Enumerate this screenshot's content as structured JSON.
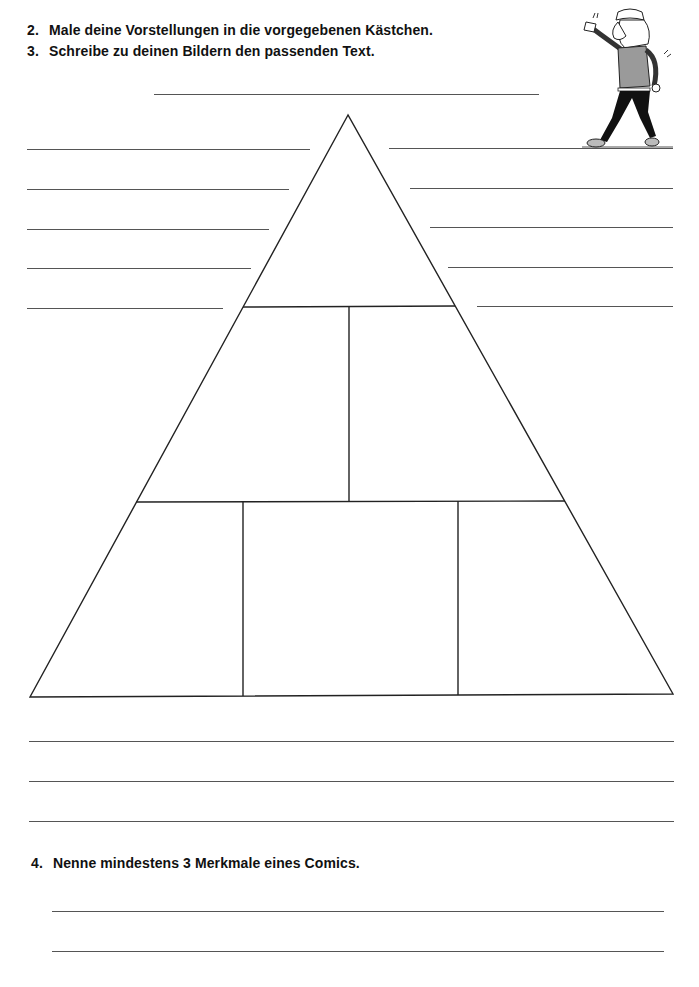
{
  "worksheet": {
    "instructions": [
      {
        "number": "2.",
        "text": "Male deine Vorstellungen in die vorgegebenen Kästchen."
      },
      {
        "number": "3.",
        "text": "Schreibe zu deinen Bildern den passenden Text."
      }
    ],
    "title_line": {
      "label": "title-answer-line"
    },
    "pyramid": {
      "levels": 3,
      "boxes_per_level": [
        1,
        2,
        3
      ]
    },
    "side_lines": {
      "left_count": 5,
      "right_count": 5
    },
    "bottom_lines_count": 3,
    "question4": {
      "number": "4.",
      "text": "Nenne mindestens 3 Merkmale eines Comics.",
      "answer_lines_count": 2
    },
    "illustration": {
      "description": "cartoon-girl-walking"
    }
  }
}
